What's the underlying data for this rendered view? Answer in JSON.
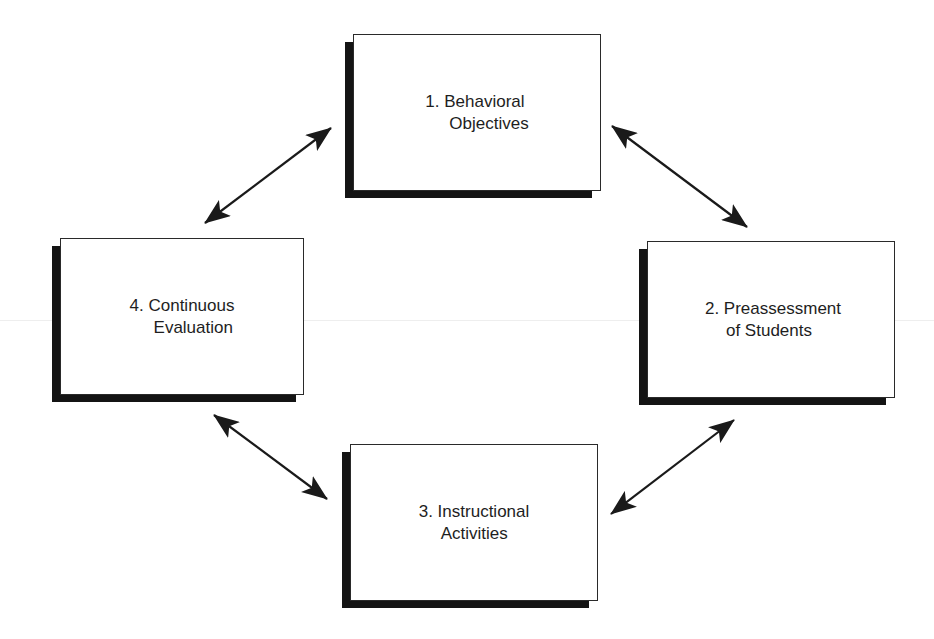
{
  "diagram": {
    "type": "cycle",
    "colors": {
      "background": "#ffffff",
      "box_border": "#2a2a2a",
      "box_shadow": "#141414",
      "text": "#1e1e1e",
      "arrow": "#1a1a1a"
    },
    "nodes": [
      {
        "id": "behavioral-objectives",
        "line1": "1. Behavioral",
        "line2": "Objectives",
        "position": "top"
      },
      {
        "id": "preassessment-of-students",
        "line1": "2. Preassessment",
        "line2": "of Students",
        "position": "right"
      },
      {
        "id": "instructional-activities",
        "line1": "3. Instructional",
        "line2": "Activities",
        "position": "bottom"
      },
      {
        "id": "continuous-evaluation",
        "line1": "4. Continuous",
        "line2": "Evaluation",
        "position": "left"
      }
    ],
    "edges": [
      {
        "from": "behavioral-objectives",
        "to": "preassessment-of-students",
        "direction": "bidirectional"
      },
      {
        "from": "preassessment-of-students",
        "to": "instructional-activities",
        "direction": "bidirectional"
      },
      {
        "from": "instructional-activities",
        "to": "continuous-evaluation",
        "direction": "bidirectional"
      },
      {
        "from": "continuous-evaluation",
        "to": "behavioral-objectives",
        "direction": "bidirectional"
      }
    ]
  }
}
